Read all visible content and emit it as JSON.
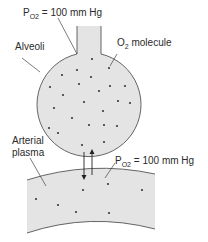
{
  "diagram": {
    "labels": {
      "alveolar_po2": {
        "main": "P",
        "sub": "O2",
        "rest": " = 100 mm Hg"
      },
      "alveoli": "Alveoli",
      "o2_molecule": {
        "main": "O",
        "sub": "2",
        "rest": " molecule"
      },
      "arterial_plasma_line1": "Arterial",
      "arterial_plasma_line2": "plasma",
      "plasma_po2": {
        "main": "P",
        "sub": "O2",
        "rest": " = 100 mm Hg"
      }
    },
    "compartments": [
      {
        "name": "alveolus",
        "label": "Alveoli",
        "po2_mmHg": 100
      },
      {
        "name": "arterial-plasma",
        "label": "Arterial plasma",
        "po2_mmHg": 100
      }
    ],
    "exchange": {
      "direction": "bidirectional",
      "net_movement": "equilibrium"
    },
    "colors": {
      "fill": "#e4e4e4",
      "outline": "#555555",
      "molecule": "#3a3a3a",
      "text": "#2b2b2b"
    }
  }
}
